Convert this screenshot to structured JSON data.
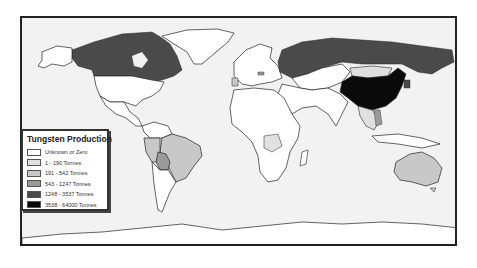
{
  "map": {
    "title": "Tungsten Production",
    "colors": {
      "ocean": "#f2f2f2",
      "unknown": "#ffffff",
      "c1": "#e0e0e0",
      "c2": "#c8c8c8",
      "c3": "#9a9a9a",
      "c4": "#4a4a4a",
      "c5": "#0a0a0a",
      "border": "#222222"
    },
    "regions": [
      {
        "name": "Canada",
        "class": "1248 - 3537 Tonnes"
      },
      {
        "name": "Russia",
        "class": "1248 - 3537 Tonnes"
      },
      {
        "name": "China",
        "class": "3538 - 64000 Tonnes"
      },
      {
        "name": "Bolivia",
        "class": "543 - 1247 Tonnes"
      },
      {
        "name": "Brazil",
        "class": "191 - 542 Tonnes"
      },
      {
        "name": "Peru",
        "class": "191 - 542 Tonnes"
      },
      {
        "name": "Australia",
        "class": "191 - 542 Tonnes"
      },
      {
        "name": "Portugal",
        "class": "191 - 542 Tonnes"
      },
      {
        "name": "Austria",
        "class": "543 - 1247 Tonnes"
      },
      {
        "name": "Mongolia",
        "class": "1 - 190 Tonnes"
      },
      {
        "name": "Rwanda",
        "class": "1 - 190 Tonnes"
      },
      {
        "name": "DR Congo",
        "class": "1 - 190 Tonnes"
      },
      {
        "name": "Thailand",
        "class": "1 - 190 Tonnes"
      },
      {
        "name": "Vietnam",
        "class": "543 - 1247 Tonnes"
      },
      {
        "name": "North Korea",
        "class": "1248 - 3537 Tonnes"
      },
      {
        "name": "United States",
        "class": "Unknown or Zero"
      },
      {
        "name": "Greenland",
        "class": "Unknown or Zero"
      },
      {
        "name": "Antarctica",
        "class": "Unknown or Zero"
      }
    ]
  },
  "legend": {
    "title": "Tungsten Production",
    "items": [
      {
        "label": "Unknown or Zero",
        "color": "#ffffff"
      },
      {
        "label": "1 - 190 Tonnes",
        "color": "#e0e0e0"
      },
      {
        "label": "191 - 542 Tonnes",
        "color": "#c8c8c8"
      },
      {
        "label": "543 - 1247 Tonnes",
        "color": "#9a9a9a"
      },
      {
        "label": "1248 - 3537 Tonnes",
        "color": "#4a4a4a"
      },
      {
        "label": "3538 - 64000 Tonnes",
        "color": "#0a0a0a"
      }
    ]
  }
}
